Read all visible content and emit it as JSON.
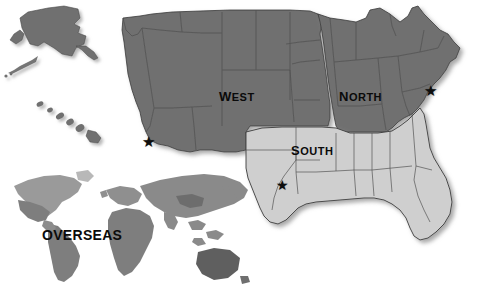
{
  "figure": {
    "background_color": "#ffffff"
  },
  "regions": [
    {
      "id": "west",
      "label": "West",
      "fill_color": "#6f6f6f",
      "star_marker": "★"
    },
    {
      "id": "north",
      "label": "North",
      "fill_color": "#6f6f6f",
      "star_marker": "★"
    },
    {
      "id": "south",
      "label": "South",
      "fill_color": "#cfcfcf",
      "star_marker": "★"
    },
    {
      "id": "overseas",
      "label": "OVERSEAS",
      "fill_color": "#8a8a8a",
      "star_marker": ""
    }
  ],
  "inset": {
    "name": "world-map",
    "label": "OVERSEAS"
  },
  "credit": {
    "text": "Courtesy of TRICARE Management Activity, www.tricare.osd.mil",
    "color": "#5b5b5b"
  },
  "colors": {
    "dark_gray": "#6f6f6f",
    "light_gray": "#cfcfcf",
    "darker_gray": "#5d5d5d",
    "border": "#3a3a3a",
    "shadow": "#b9b9b9",
    "text": "#0a0a0a"
  }
}
